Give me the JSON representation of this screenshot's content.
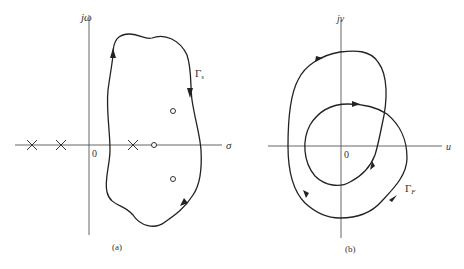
{
  "figure_a": {
    "caption": "(a)",
    "y_axis_label": "jω",
    "x_axis_label": "σ",
    "origin_label": "0",
    "contour_label": "Γ",
    "contour_subscript": "s",
    "poles": [
      {
        "x": 32,
        "y": 145
      },
      {
        "x": 61,
        "y": 145
      },
      {
        "x": 133,
        "y": 145
      }
    ],
    "zeros": [
      {
        "x": 154,
        "y": 145
      },
      {
        "x": 173,
        "y": 111
      },
      {
        "x": 173,
        "y": 179
      }
    ]
  },
  "figure_b": {
    "caption": "(b)",
    "y_axis_label": "jv",
    "x_axis_label": "u",
    "origin_label": "0",
    "contour_label": "Γ",
    "contour_subscript": "F"
  },
  "colors": {
    "curve": "#222222",
    "axis": "#555555",
    "text": "#333333"
  }
}
